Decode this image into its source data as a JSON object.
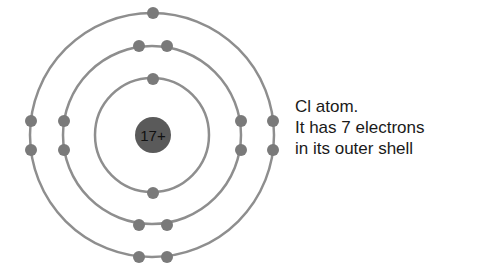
{
  "diagram": {
    "nucleus": {
      "label": "17+",
      "color": "#5a5a5a",
      "radius": 18
    },
    "center": {
      "x": 152,
      "y": 135
    },
    "colors": {
      "shell": "#8e8e8e",
      "electron": "#7a7a7a",
      "text": "#1a1a1a"
    },
    "shells": [
      {
        "name": "inner",
        "radius": 57,
        "electrons": 2
      },
      {
        "name": "middle",
        "radius": 89,
        "electrons": 8
      },
      {
        "name": "outer",
        "radius": 122,
        "electrons": 7
      }
    ],
    "caption": {
      "lines": [
        "Cl atom.",
        "It has 7 electrons",
        "in its outer shell"
      ]
    }
  }
}
